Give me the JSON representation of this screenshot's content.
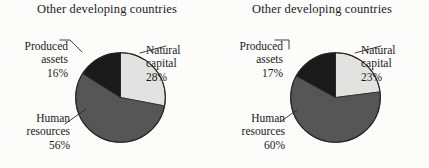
{
  "figure": {
    "background_color": "#fdfdfc",
    "panels": [
      {
        "id": "left",
        "title": "Other developing countries",
        "callouts": {
          "produced": {
            "name": "Produced",
            "name2": "assets",
            "value": "16%"
          },
          "natural": {
            "name": "Natural",
            "name2": "capital",
            "value": "28%"
          },
          "human": {
            "name": "Human",
            "name2": "resources",
            "value": "56%"
          }
        }
      },
      {
        "id": "right",
        "title": "Other developing countries",
        "callouts": {
          "produced": {
            "name": "Produced",
            "name2": "assets",
            "value": "17%"
          },
          "natural": {
            "name": "Natural",
            "name2": "capital",
            "value": "23%"
          },
          "human": {
            "name": "Human",
            "name2": "resources",
            "value": "60%"
          }
        }
      }
    ]
  },
  "colors": {
    "natural_capital": "#e3e3e1",
    "human_resources": "#565656",
    "produced_assets": "#1a1a1a",
    "outline": "#262626",
    "text": "#1b1b1b"
  },
  "chart_data": [
    {
      "type": "pie",
      "title": "Other developing countries",
      "xlabel": "",
      "ylabel": "",
      "start_angle_deg": 0,
      "direction": "clockwise",
      "legend": "none (direct labels with leader lines)",
      "grid": false,
      "categories": [
        "Natural capital",
        "Human resources",
        "Produced assets"
      ],
      "values": [
        28,
        56,
        16
      ],
      "value_labels": [
        "28%",
        "56%",
        "16%"
      ],
      "units": "percent",
      "slice_colors": [
        "#e3e3e1",
        "#565656",
        "#1a1a1a"
      ]
    },
    {
      "type": "pie",
      "title": "Other developing countries",
      "xlabel": "",
      "ylabel": "",
      "start_angle_deg": 0,
      "direction": "clockwise",
      "legend": "none (direct labels with leader lines)",
      "grid": false,
      "categories": [
        "Natural capital",
        "Human resources",
        "Produced assets"
      ],
      "values": [
        23,
        60,
        17
      ],
      "value_labels": [
        "23%",
        "60%",
        "17%"
      ],
      "units": "percent",
      "slice_colors": [
        "#e3e3e1",
        "#565656",
        "#1a1a1a"
      ]
    }
  ]
}
